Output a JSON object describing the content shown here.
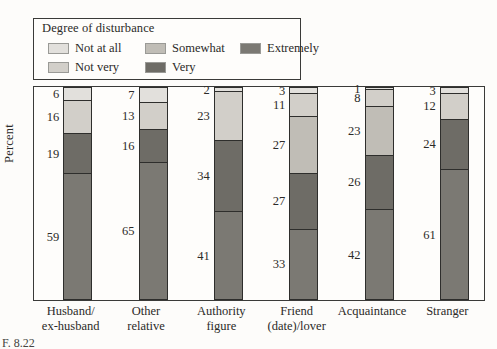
{
  "legend": {
    "title": "Degree of disturbance",
    "items": [
      {
        "label": "Not at all",
        "key": "not_at_all",
        "color": "#e2e0dc",
        "row": 1,
        "col": 1
      },
      {
        "label": "Somewhat",
        "key": "somewhat",
        "color": "#c0bdb6",
        "row": 1,
        "col": 2
      },
      {
        "label": "Extremely",
        "key": "extremely",
        "color": "#7b7973",
        "row": 1,
        "col": 3
      },
      {
        "label": "Not very",
        "key": "not_very",
        "color": "#d2cfc9",
        "row": 2,
        "col": 1
      },
      {
        "label": "Very",
        "key": "very",
        "color": "#6e6c66",
        "row": 2,
        "col": 2
      }
    ]
  },
  "axes": {
    "ylabel": "Percent",
    "ylim": [
      0,
      100
    ],
    "grid": false
  },
  "figure_caption": "F. 8.22",
  "chart_data": {
    "type": "bar",
    "stacked": true,
    "title": "",
    "xlabel": "",
    "ylabel": "Percent",
    "ylim": [
      0,
      100
    ],
    "grid": false,
    "legend_position": "top-left",
    "legend_title": "Degree of disturbance",
    "categories": [
      "Husband/\nex-husband",
      "Other\nrelative",
      "Authority\nfigure",
      "Friend\n(date)/lover",
      "Acquaintance",
      "Stranger"
    ],
    "series": [
      {
        "name": "Not at all",
        "color": "#e2e0dc",
        "values": [
          6,
          7,
          2,
          3,
          1,
          3
        ]
      },
      {
        "name": "Not very",
        "color": "#d2cfc9",
        "values": [
          16,
          13,
          23,
          11,
          8,
          12
        ]
      },
      {
        "name": "Somewhat",
        "color": "#c0bdb6",
        "values": [
          null,
          null,
          null,
          27,
          23,
          null
        ]
      },
      {
        "name": "Very",
        "color": "#6e6c66",
        "values": [
          19,
          16,
          34,
          27,
          26,
          24
        ]
      },
      {
        "name": "Extremely",
        "color": "#7b7973",
        "values": [
          59,
          65,
          41,
          33,
          42,
          61
        ]
      }
    ]
  },
  "x_labels": [
    {
      "line1": "Husband/",
      "line2": "ex-husband"
    },
    {
      "line1": "Other",
      "line2": "relative"
    },
    {
      "line1": "Authority",
      "line2": "figure"
    },
    {
      "line1": "Friend",
      "line2": "(date)/lover"
    },
    {
      "line1": "Acquaintance",
      "line2": ""
    },
    {
      "line1": "Stranger",
      "line2": ""
    }
  ]
}
